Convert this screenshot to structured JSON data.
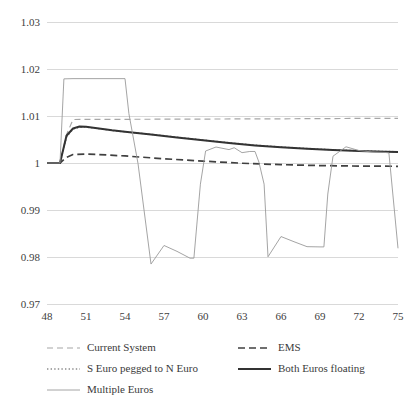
{
  "chart_data": {
    "type": "line",
    "title": "",
    "subtitle": "",
    "xlabel": "",
    "ylabel": "",
    "xlim": [
      48,
      75
    ],
    "ylim": [
      0.97,
      1.03
    ],
    "xticks": [
      48,
      51,
      54,
      57,
      60,
      63,
      66,
      69,
      72,
      75
    ],
    "yticks": [
      "1.03",
      "1.02",
      "1.01",
      "1",
      "0.99",
      "0.98",
      "0.97"
    ],
    "ytick_values": [
      1.03,
      1.02,
      1.01,
      1.0,
      0.99,
      0.98,
      0.97
    ],
    "grid": true,
    "legend_position": "bottom",
    "series": [
      {
        "name": "Current System",
        "style": "dashed",
        "color": "#a6a6a6",
        "width": 1.2,
        "x": [
          48,
          49,
          49.5,
          50,
          51,
          54,
          57,
          60,
          63,
          66,
          69,
          72,
          75
        ],
        "values": [
          1.0,
          1.0,
          1.006,
          1.00925,
          1.00928,
          1.0093,
          1.00932,
          1.00935,
          1.00938,
          1.0094,
          1.00945,
          1.00948,
          1.0095
        ]
      },
      {
        "name": "EMS",
        "style": "dashed",
        "color": "#404040",
        "width": 1.7,
        "x": [
          48,
          49,
          49.5,
          50,
          51,
          52,
          54,
          57,
          60,
          63,
          66,
          69,
          72,
          75
        ],
        "values": [
          1.0,
          1.0,
          1.0012,
          1.0018,
          1.0019,
          1.0018,
          1.0015,
          1.0009,
          1.0004,
          0.99995,
          0.99965,
          0.99945,
          0.99935,
          0.9993
        ]
      },
      {
        "name": "S Euro pegged to N Euro",
        "style": "dotted",
        "color": "#8c8c8c",
        "width": 1.5,
        "x": [
          48,
          49,
          49.5,
          50,
          50.5,
          51,
          52,
          53,
          54,
          56,
          58,
          60,
          62,
          64,
          66,
          68,
          70,
          72,
          74,
          75
        ],
        "values": [
          1.0,
          1.0,
          1.0055,
          1.0072,
          1.0076,
          1.00765,
          1.0073,
          1.0069,
          1.00665,
          1.0061,
          1.0055,
          1.0049,
          1.0043,
          1.0038,
          1.0034,
          1.0031,
          1.0028,
          1.0026,
          1.00245,
          1.0024
        ]
      },
      {
        "name": "Both Euros floating",
        "style": "solid",
        "color": "#333333",
        "width": 2,
        "x": [
          48,
          49,
          49.5,
          50,
          50.5,
          51,
          52,
          53,
          54,
          56,
          58,
          60,
          62,
          64,
          66,
          68,
          70,
          72,
          74,
          75
        ],
        "values": [
          1.0,
          1.0,
          1.0058,
          1.00735,
          1.00775,
          1.00772,
          1.00735,
          1.00695,
          1.00665,
          1.00605,
          1.00545,
          1.00485,
          1.00425,
          1.00375,
          1.00335,
          1.00302,
          1.00275,
          1.00255,
          1.00238,
          1.00232
        ]
      },
      {
        "name": "Multiple Euros",
        "style": "solid",
        "color": "#9a9a9a",
        "width": 0.9,
        "x": [
          48,
          49,
          49.3,
          50,
          54,
          54.3,
          55,
          56,
          57,
          58,
          59,
          59.3,
          59.8,
          60.2,
          61,
          62,
          62.4,
          63,
          63.6,
          64,
          64.3,
          64.7,
          65,
          66,
          67,
          68,
          69,
          69.3,
          69.6,
          70,
          71,
          72,
          73,
          74,
          74.3,
          75
        ],
        "values": [
          1.0,
          1.0,
          1.0179,
          1.01795,
          1.01795,
          1.0105,
          0.9999,
          0.9785,
          0.98245,
          0.9812,
          0.97975,
          0.97975,
          0.9955,
          1.00255,
          1.0034,
          1.00285,
          1.00325,
          1.0022,
          1.00245,
          1.00245,
          1.0002,
          0.9955,
          0.98005,
          0.98435,
          0.98325,
          0.9822,
          0.98215,
          0.98215,
          0.9934,
          1.00145,
          1.00345,
          1.00265,
          1.00235,
          1.00225,
          1.00215,
          0.98185
        ]
      }
    ]
  },
  "legend": {
    "entries": [
      {
        "label": "Current System",
        "style": "dashed",
        "color": "#a6a6a6",
        "width": 1.2
      },
      {
        "label": "EMS",
        "style": "dashed",
        "color": "#404040",
        "width": 1.7
      },
      {
        "label": "S Euro pegged to N Euro",
        "style": "dotted",
        "color": "#8c8c8c",
        "width": 1.5
      },
      {
        "label": "Both Euros floating",
        "style": "solid",
        "color": "#333333",
        "width": 2
      },
      {
        "label": "Multiple Euros",
        "style": "solid",
        "color": "#9a9a9a",
        "width": 0.9
      }
    ]
  },
  "colors": {
    "gridline": "#d9d9d9",
    "text": "#3a3a3a",
    "background": "#ffffff"
  }
}
